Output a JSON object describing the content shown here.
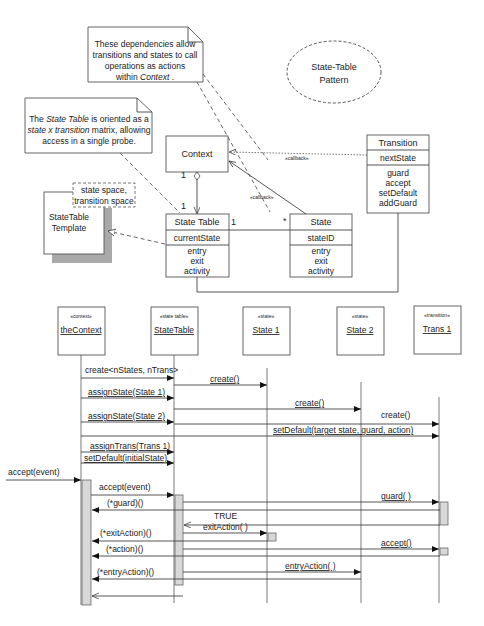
{
  "title_ellipse": {
    "line1": "State-Table",
    "line2": "Pattern"
  },
  "notes": {
    "dependencies": {
      "lines": [
        "These dependencies allow",
        "transitions and states to call",
        "operations as actions"
      ],
      "last_prefix": "within ",
      "last_italic": "Context",
      "last_suffix": " ."
    },
    "orientation": {
      "line1_prefix": "The ",
      "line1_italic": "State Table",
      "line1_suffix": " is oriented as a",
      "line2_italic": "state x transition",
      "line2_suffix": " matrix, allowing",
      "line3": "access in a single probe."
    }
  },
  "template": {
    "name_line1": "StateTable",
    "name_line2": "Template",
    "params_line1": "state space,",
    "params_line2": "transition space"
  },
  "classes": {
    "context": {
      "name": "Context"
    },
    "state_table": {
      "name": "State Table",
      "attribute": "currentState",
      "operations": [
        "entry",
        "exit",
        "activity"
      ]
    },
    "state": {
      "name": "State",
      "attribute": "stateID",
      "operations": [
        "entry",
        "exit",
        "activity"
      ]
    },
    "transition": {
      "name": "Transition",
      "attribute": "nextState",
      "operations": [
        "guard",
        "accept",
        "setDefault",
        "addGuard"
      ]
    }
  },
  "associations": {
    "context_mult": "1",
    "statetable_top_mult": "1",
    "statetable_right_mult": "1",
    "state_mult": "*",
    "callback_transition": "«callback»",
    "callback_state": "«callback»"
  },
  "sequence": {
    "lifelines": [
      {
        "stereotype": "«context»",
        "name": "theContext"
      },
      {
        "stereotype": "«state table»",
        "name": "StateTable"
      },
      {
        "stereotype": "«state»",
        "name": "State 1"
      },
      {
        "stereotype": "«state»",
        "name": "State 2"
      },
      {
        "stereotype": "«transition»",
        "name": "Trans 1"
      }
    ],
    "messages": {
      "create_table": "create<nStates, nTrans>",
      "create_s1": "create()",
      "assign_s1": "assignState(State 1)",
      "create_s2": "create()",
      "assign_s2": "assignState(State 2)",
      "create_t1": "create()",
      "set_default_t1": "setDefault(target state, guard, action)",
      "assign_trans": "assignTrans(Trans 1)",
      "set_default_init": "setDefault(initialState)",
      "accept_external": "accept(event)",
      "accept_table": "accept(event)",
      "guard_call": "guard( )",
      "guard_ptr": "(*guard)()",
      "true_return": "TRUE",
      "exit_action": "exitAction( )",
      "exit_ptr": "(*exitAction)()",
      "accept_call": "accept()",
      "action_ptr": "(*action)()",
      "entry_action": "entryAction( )",
      "entry_ptr": "(*entryAction)()"
    }
  }
}
